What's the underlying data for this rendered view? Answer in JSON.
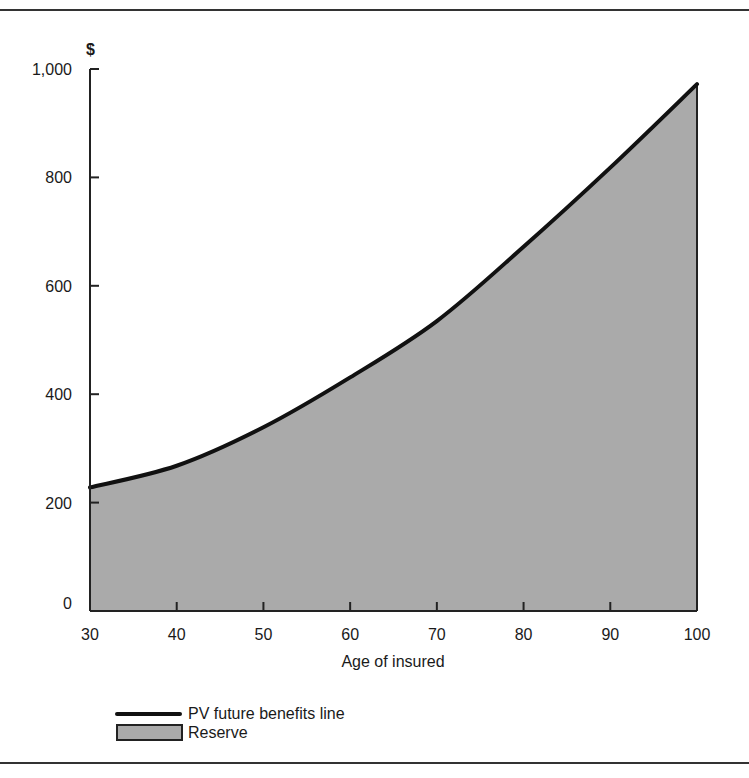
{
  "chart_data": {
    "type": "area",
    "title": "",
    "xlabel": "Age of insured",
    "ylabel": "$",
    "x": [
      30,
      40,
      50,
      60,
      70,
      80,
      90,
      100
    ],
    "series": [
      {
        "name": "PV future benefits line",
        "style": "line",
        "values": [
          228,
          268,
          339,
          431,
          535,
          672,
          818,
          972
        ]
      },
      {
        "name": "Reserve",
        "style": "filled-area",
        "values": [
          228,
          268,
          339,
          431,
          535,
          672,
          818,
          972
        ]
      }
    ],
    "xlim": [
      30,
      100
    ],
    "ylim": [
      0,
      1000
    ],
    "x_ticks": [
      "30",
      "40",
      "50",
      "60",
      "70",
      "80",
      "90",
      "100"
    ],
    "y_ticks": [
      "0",
      "200",
      "400",
      "600",
      "800",
      "1,000"
    ],
    "grid": false,
    "legend_position": "bottom-left"
  },
  "colors": {
    "line": "#111111",
    "fill": "#aaaaaa",
    "axis": "#222222"
  },
  "legend": {
    "line_label": "PV future benefits line",
    "area_label": "Reserve"
  }
}
